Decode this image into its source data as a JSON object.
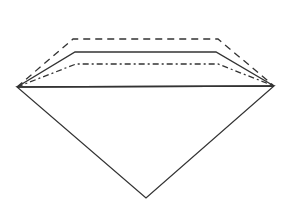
{
  "diagram": {
    "type": "gem-outline",
    "stroke_color": "#333333",
    "background": "#ffffff",
    "pavilion": {
      "left": [
        17,
        87
      ],
      "right": [
        274,
        86
      ],
      "bottom": [
        146,
        198
      ]
    },
    "girdle": {
      "from": [
        17,
        87
      ],
      "to": [
        274,
        86
      ]
    },
    "crowns": [
      {
        "style": "dashed",
        "points": [
          [
            17,
            87
          ],
          [
            73,
            39
          ],
          [
            218,
            39
          ],
          [
            274,
            86
          ]
        ]
      },
      {
        "style": "solid",
        "points": [
          [
            17,
            87
          ],
          [
            75,
            52
          ],
          [
            216,
            52
          ],
          [
            274,
            86
          ]
        ]
      },
      {
        "style": "dash-dot",
        "points": [
          [
            17,
            87
          ],
          [
            76,
            64
          ],
          [
            218,
            64
          ],
          [
            274,
            86
          ]
        ]
      }
    ]
  }
}
